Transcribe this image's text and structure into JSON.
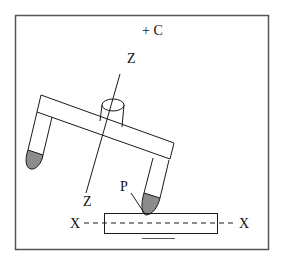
{
  "figure": {
    "labels": {
      "rotation_axis": "+ C",
      "z_top": "Z",
      "z_bottom": "Z",
      "contact_point": "P",
      "x_left": "X",
      "x_right": "X"
    },
    "colors": {
      "stroke": "#1a1a1a",
      "frame": "#555555",
      "tip_fill": "#8c8c8c",
      "background": "#ffffff"
    }
  }
}
